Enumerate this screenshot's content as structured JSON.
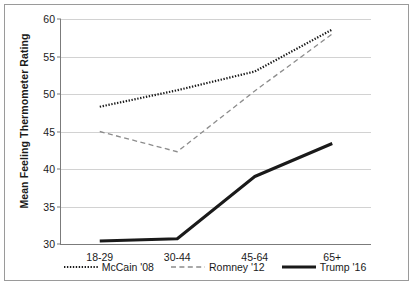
{
  "chart_data": {
    "type": "line",
    "title": "",
    "xlabel": "",
    "ylabel": "Mean Feeling Thermometer Rating",
    "categories": [
      "18-29",
      "30-44",
      "45-64",
      "65+"
    ],
    "ylim": [
      30,
      60
    ],
    "yticks": [
      30,
      35,
      40,
      45,
      50,
      55,
      60
    ],
    "grid": true,
    "legend_position": "bottom",
    "series": [
      {
        "name": "McCain '08",
        "values": [
          48.3,
          50.5,
          53.0,
          58.6
        ],
        "style": "dotted",
        "color": "#1a1a1a",
        "width": 2.2
      },
      {
        "name": "Romney '12",
        "values": [
          45.0,
          42.3,
          50.4,
          58.0
        ],
        "style": "dashed",
        "color": "#8c8c8c",
        "width": 1.3
      },
      {
        "name": "Trump '16",
        "values": [
          30.4,
          30.7,
          39.0,
          43.4
        ],
        "style": "solid",
        "color": "#1a1a1a",
        "width": 3.0
      }
    ]
  },
  "axis": {
    "y_title": "Mean Feeling Thermometer Rating",
    "y_tick_labels": [
      "60",
      "55",
      "50",
      "45",
      "40",
      "35",
      "30"
    ],
    "x_tick_labels": [
      "18-29",
      "30-44",
      "45-64",
      "65+"
    ]
  },
  "legend": {
    "entries": [
      {
        "label": "McCain '08"
      },
      {
        "label": "Romney '12"
      },
      {
        "label": "Trump '16"
      }
    ]
  }
}
